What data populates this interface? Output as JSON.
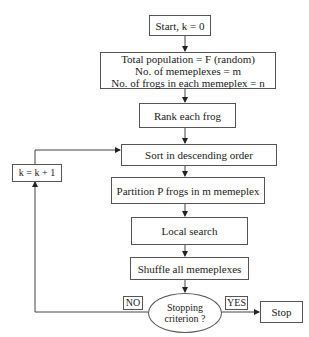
{
  "diagram": {
    "type": "flowchart",
    "nodes": {
      "start": "Start, k = 0",
      "init": {
        "lines": [
          "Total population = F (random)",
          "No. of memeplexes  = m",
          "No. of frogs in each memeplex = n"
        ]
      },
      "rank": "Rank each frog",
      "sort": "Sort in descending order",
      "partition": "Partition P frogs in m memeplex",
      "local_search": "Local search",
      "shuffle": "Shuffle all memeplexes",
      "decision": {
        "lines": [
          "Stopping",
          "criterion ?"
        ]
      },
      "stop": "Stop",
      "increment": "k = k + 1"
    },
    "edge_labels": {
      "no": "NO",
      "yes": "YES"
    },
    "edges": [
      {
        "from": "start",
        "to": "init"
      },
      {
        "from": "init",
        "to": "rank"
      },
      {
        "from": "rank",
        "to": "sort"
      },
      {
        "from": "sort",
        "to": "partition"
      },
      {
        "from": "partition",
        "to": "local_search"
      },
      {
        "from": "local_search",
        "to": "shuffle"
      },
      {
        "from": "shuffle",
        "to": "decision"
      },
      {
        "from": "decision",
        "to": "stop",
        "label": "YES"
      },
      {
        "from": "decision",
        "to": "increment",
        "label": "NO"
      },
      {
        "from": "increment",
        "to": "sort"
      }
    ]
  }
}
